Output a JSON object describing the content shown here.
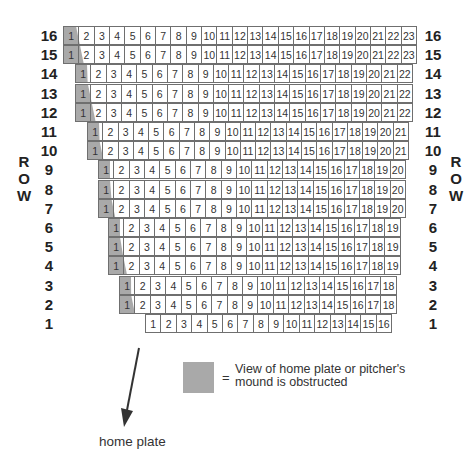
{
  "diagram": {
    "side_label_left": [
      "R",
      "O",
      "W"
    ],
    "side_label_right": [
      "R",
      "O",
      "W"
    ],
    "rows": [
      {
        "row": "16",
        "seats": 23,
        "left": 63,
        "width": 354
      },
      {
        "row": "15",
        "seats": 23,
        "left": 63,
        "width": 354
      },
      {
        "row": "14",
        "seats": 22,
        "left": 75,
        "width": 338
      },
      {
        "row": "13",
        "seats": 22,
        "left": 75,
        "width": 338
      },
      {
        "row": "12",
        "seats": 22,
        "left": 75,
        "width": 338
      },
      {
        "row": "11",
        "seats": 21,
        "left": 87,
        "width": 322
      },
      {
        "row": "10",
        "seats": 21,
        "left": 87,
        "width": 322
      },
      {
        "row": "9",
        "seats": 20,
        "left": 98,
        "width": 308
      },
      {
        "row": "8",
        "seats": 20,
        "left": 98,
        "width": 308
      },
      {
        "row": "7",
        "seats": 20,
        "left": 98,
        "width": 308
      },
      {
        "row": "6",
        "seats": 19,
        "left": 108,
        "width": 293
      },
      {
        "row": "5",
        "seats": 19,
        "left": 108,
        "width": 293
      },
      {
        "row": "4",
        "seats": 19,
        "left": 108,
        "width": 293
      },
      {
        "row": "3",
        "seats": 18,
        "left": 119,
        "width": 278
      },
      {
        "row": "2",
        "seats": 18,
        "left": 119,
        "width": 278
      },
      {
        "row": "1",
        "seats": 16,
        "left": 145,
        "width": 247
      }
    ],
    "obstructed_color": "#a9a9a9",
    "grid_color": "#6f6f6f",
    "legend": {
      "symbol": "=",
      "line1": "View of home plate or pitcher's",
      "line2": "mound is obstructed"
    },
    "arrow_label": "home plate"
  }
}
